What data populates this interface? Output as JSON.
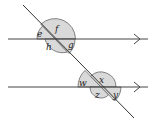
{
  "diagram": {
    "title": "",
    "labels": {
      "e": "e",
      "f": "f",
      "g": "g",
      "h": "h",
      "w": "w",
      "x": "x",
      "y": "y",
      "z": "z"
    },
    "colors": {
      "line": "#333333",
      "shade": "#d9d9d9",
      "arc": "#555555"
    }
  }
}
